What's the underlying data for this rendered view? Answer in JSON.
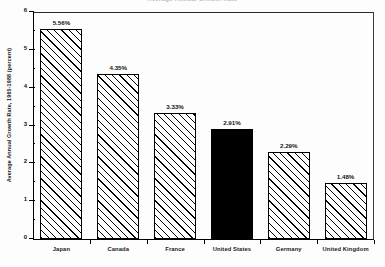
{
  "chart_data": {
    "type": "bar",
    "title": "Average Annual Growth Rate",
    "xlabel": "",
    "ylabel": "Average Annual Growth Rate, 1965-1988 (percent)",
    "categories": [
      "Japan",
      "Canada",
      "France",
      "United States",
      "Germany",
      "United Kingdom"
    ],
    "values": [
      5.56,
      4.35,
      3.33,
      2.91,
      2.29,
      1.48
    ],
    "value_labels": [
      "5.56%",
      "4.35%",
      "3.33%",
      "2.91%",
      "2.29%",
      "1.48%"
    ],
    "ylim": [
      0,
      6
    ],
    "ytick_labels": [
      "0",
      "1",
      "2",
      "3",
      "4",
      "5",
      "6"
    ],
    "ytick_values": [
      0,
      1,
      2,
      3,
      4,
      5,
      6
    ],
    "grid": false,
    "legend": false,
    "bar_styles": [
      "hatched",
      "hatched",
      "hatched",
      "solid",
      "hatched",
      "hatched"
    ],
    "highlight_category": "United States",
    "colors": {
      "bar_fill": "#ffffff",
      "bar_hatch": "#000000",
      "bar_edge": "#000000",
      "highlight_fill": "#000000",
      "axis": "#000000",
      "background": "#ffffff"
    }
  }
}
